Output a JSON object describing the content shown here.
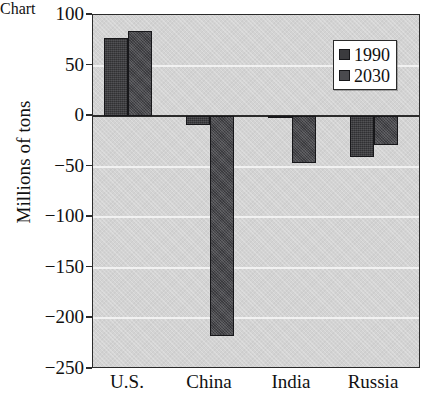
{
  "chart_data": {
    "type": "bar",
    "title": "",
    "xlabel": "",
    "ylabel": "Millions of tons",
    "categories": [
      "U.S.",
      "China",
      "India",
      "Russia"
    ],
    "series": [
      {
        "name": "1990",
        "color": "#3b3b3e",
        "values": [
          77,
          -9,
          -2,
          -40
        ]
      },
      {
        "name": "2030",
        "color": "#4a4a4e",
        "values": [
          84,
          -217,
          -46,
          -29
        ]
      }
    ],
    "ylim": [
      -250,
      100
    ],
    "ytick_values": [
      100,
      50,
      0,
      -50,
      -100,
      -150,
      -200,
      -250
    ],
    "ytick_labels": [
      "100",
      "50",
      "0",
      "−50",
      "−100",
      "−150",
      "−200",
      "−250"
    ],
    "grid": true,
    "gridlines_at": [
      50,
      -50,
      -100,
      -150,
      -200
    ],
    "zero_line": 0,
    "legend": {
      "position": "top-right",
      "entries": [
        {
          "label": "1990",
          "swatch": "dark-gray-square"
        },
        {
          "label": "2030",
          "swatch": "dark-gray-square"
        }
      ]
    },
    "plot_background": "#d3d3d3",
    "gridline_color": "#f2f2f2",
    "axis_color": "#2b2b2b",
    "bar_outline_color": "#17171a"
  },
  "figure": {
    "title_sliver": ""
  }
}
